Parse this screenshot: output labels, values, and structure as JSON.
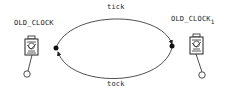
{
  "nodes": [
    {
      "id": "left",
      "label": "OLD_CLOCK",
      "subscript": "",
      "icon": "pendulum-clock-icon"
    },
    {
      "id": "right",
      "label": "OLD_CLOCK",
      "subscript": "1",
      "icon": "pendulum-clock-icon"
    }
  ],
  "edges": [
    {
      "from": "left",
      "to": "right",
      "label": "tick",
      "position": "top"
    },
    {
      "from": "right",
      "to": "left",
      "label": "tock",
      "position": "bottom"
    }
  ],
  "colors": {
    "line": "#222222",
    "text": "#222222",
    "background": "#ffffff"
  }
}
